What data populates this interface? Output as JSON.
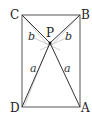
{
  "figure": {
    "points": {
      "A": {
        "label": "A",
        "x": 80,
        "y": 107
      },
      "B": {
        "label": "B",
        "x": 80,
        "y": 15
      },
      "C": {
        "label": "C",
        "x": 22,
        "y": 15
      },
      "D": {
        "label": "D",
        "x": 22,
        "y": 107
      },
      "P": {
        "label": "P",
        "x": 50,
        "y": 43
      }
    },
    "segment_labels": {
      "CP": "b",
      "BP": "b",
      "DP": "a",
      "AP": "a"
    },
    "colors": {
      "stroke": "#333333",
      "auxiliary": "#aaaaaa"
    }
  }
}
